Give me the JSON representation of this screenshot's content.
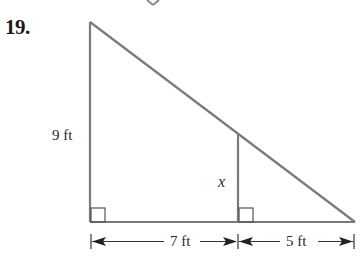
{
  "problem": {
    "number": "19."
  },
  "figure": {
    "type": "similar-right-triangles",
    "labels": {
      "left_side": "9 ft",
      "inner_side": "x",
      "base_left_segment": "7 ft",
      "base_right_segment": "5 ft"
    },
    "colors": {
      "line": "#7a7a7a",
      "text": "#2a2a2a",
      "background": "#ffffff"
    }
  }
}
